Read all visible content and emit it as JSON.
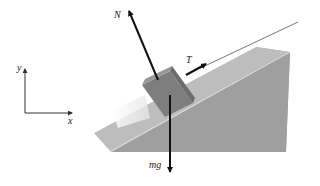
{
  "diagram": {
    "axes": {
      "x_label": "x",
      "y_label": "y"
    },
    "forces": [
      {
        "name": "normal",
        "label": "N"
      },
      {
        "name": "tension",
        "label": "T"
      },
      {
        "name": "weight",
        "label": "mg"
      }
    ],
    "colors": {
      "wedge_top": "#b9b9b9",
      "wedge_front": "#9d9d9d",
      "block": "#7e7e7e",
      "block_top": "#959595",
      "arrow": "#111111"
    }
  }
}
